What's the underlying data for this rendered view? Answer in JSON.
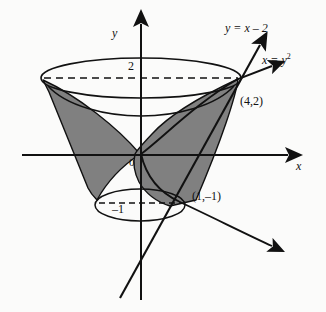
{
  "figure": {
    "background_color": "#fbfbfa",
    "ink_color": "#111111",
    "shade_color": "#808080",
    "axes": {
      "x_label": "x",
      "y_label": "y",
      "origin_label": "0"
    },
    "ticks": {
      "y_upper": "2",
      "y_lower": "–1"
    },
    "curves": [
      {
        "name": "parabola",
        "label": "x = y",
        "label_superscript": "2",
        "equation": "x = y^2"
      },
      {
        "name": "line",
        "label_lhs": "y = x – 2",
        "equation": "y = x - 2"
      }
    ],
    "points": [
      {
        "name": "upper-intersection",
        "label": "(4,2)",
        "x": 4,
        "y": 2
      },
      {
        "name": "lower-intersection",
        "label": "(1,–1)",
        "x": 1,
        "y": -1
      }
    ]
  }
}
